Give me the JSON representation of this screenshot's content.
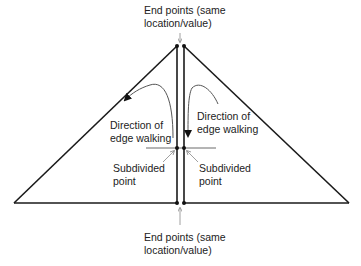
{
  "labels": {
    "top_endpoints": [
      "End points (same",
      "location/value)"
    ],
    "left_direction": [
      "Direction of",
      "edge walking"
    ],
    "right_direction": [
      "Direction of",
      "edge walking"
    ],
    "left_subdivided": [
      "Subdivided",
      "point"
    ],
    "right_subdivided": [
      "Subdivided",
      "point"
    ],
    "bottom_endpoints": [
      "End points (same",
      "location/value)"
    ]
  },
  "colors": {
    "line": "#1a1a1a",
    "arrow": "#555555",
    "pointer": "#888888",
    "text": "#222222"
  }
}
